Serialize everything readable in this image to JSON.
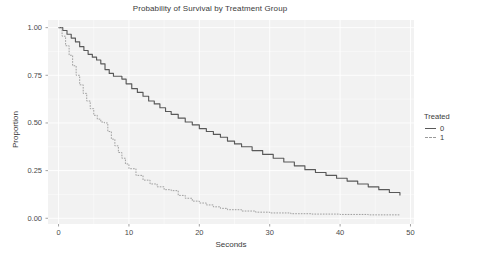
{
  "chart_data": {
    "type": "line",
    "title": "Probability of Survival by Treatment Group",
    "xlabel": "Seconds",
    "ylabel": "Proportion",
    "xlim": [
      -1.5,
      50.5
    ],
    "ylim": [
      -0.03,
      1.04
    ],
    "xticks": [
      0,
      10,
      20,
      30,
      40,
      50
    ],
    "xtick_labels": [
      "0",
      "10",
      "20",
      "30",
      "40",
      "50"
    ],
    "yticks": [
      0.0,
      0.25,
      0.5,
      0.75,
      1.0
    ],
    "ytick_labels": [
      "0.00",
      "0.25",
      "0.50",
      "0.75",
      "1.00"
    ],
    "grid": true,
    "grid_color": "#ffffff",
    "panel_background": "#f2f2f2",
    "legend": {
      "title": "Treated",
      "position": "right",
      "entries": [
        {
          "label": "0",
          "linestyle": "solid",
          "color": "#595959"
        },
        {
          "label": "1",
          "linestyle": "dashed",
          "color": "#9a9a9a"
        }
      ]
    },
    "series": [
      {
        "name": "0",
        "linestyle": "solid",
        "color": "#595959",
        "x": [
          0,
          0.6,
          1.2,
          1.8,
          2.4,
          3.0,
          3.6,
          4.2,
          4.8,
          5.4,
          6.0,
          6.6,
          7.2,
          7.8,
          8.4,
          9.0,
          9.6,
          10.4,
          11.2,
          12.0,
          12.8,
          13.6,
          14.4,
          15.2,
          16.0,
          17.0,
          18.0,
          19.0,
          20.0,
          21.0,
          22.0,
          23.0,
          24.0,
          25.0,
          26.0,
          27.5,
          29.0,
          30.5,
          32.0,
          33.5,
          35.0,
          36.5,
          38.0,
          39.5,
          41.0,
          42.5,
          44.0,
          45.5,
          47.0,
          48.5
        ],
        "y": [
          1.0,
          0.985,
          0.965,
          0.945,
          0.925,
          0.9,
          0.88,
          0.86,
          0.845,
          0.83,
          0.81,
          0.78,
          0.76,
          0.745,
          0.745,
          0.73,
          0.705,
          0.68,
          0.66,
          0.64,
          0.615,
          0.6,
          0.58,
          0.56,
          0.545,
          0.525,
          0.505,
          0.49,
          0.47,
          0.455,
          0.44,
          0.425,
          0.405,
          0.39,
          0.375,
          0.355,
          0.335,
          0.315,
          0.295,
          0.275,
          0.255,
          0.24,
          0.225,
          0.21,
          0.195,
          0.18,
          0.165,
          0.15,
          0.135,
          0.12
        ]
      },
      {
        "name": "1",
        "linestyle": "dashed",
        "color": "#9a9a9a",
        "x": [
          0,
          0.5,
          1.0,
          1.5,
          2.0,
          2.5,
          3.0,
          3.5,
          4.0,
          4.5,
          5.0,
          5.5,
          6.0,
          6.5,
          7.0,
          7.5,
          8.0,
          8.5,
          9.0,
          9.5,
          10.0,
          11.0,
          12.0,
          13.0,
          14.0,
          15.0,
          16.0,
          17.0,
          18.0,
          19.0,
          20.0,
          21.0,
          22.0,
          23.0,
          24.0,
          26.0,
          28.0,
          30.0,
          33.0,
          36.0,
          40.0,
          44.0,
          48.5
        ],
        "y": [
          1.0,
          0.955,
          0.905,
          0.855,
          0.8,
          0.75,
          0.7,
          0.655,
          0.615,
          0.575,
          0.54,
          0.52,
          0.505,
          0.5,
          0.455,
          0.415,
          0.38,
          0.345,
          0.315,
          0.285,
          0.26,
          0.225,
          0.2,
          0.18,
          0.165,
          0.15,
          0.145,
          0.12,
          0.105,
          0.09,
          0.08,
          0.07,
          0.06,
          0.052,
          0.045,
          0.038,
          0.032,
          0.028,
          0.024,
          0.022,
          0.02,
          0.018,
          0.016
        ]
      }
    ]
  }
}
